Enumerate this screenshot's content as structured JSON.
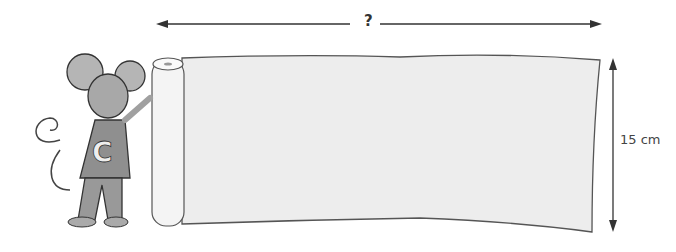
{
  "diagram": {
    "width_label": "?",
    "height_label": "15 cm",
    "character": "mouse wearing a shirt with letter C, holding a paper roll",
    "shirt_letter": "C",
    "object": "unrolled paper sheet",
    "colors": {
      "line": "#333333",
      "paper": "#ececec",
      "mouse": "#9a9a9a"
    }
  }
}
